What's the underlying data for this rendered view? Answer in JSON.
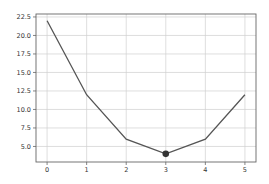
{
  "chart_data": {
    "type": "line",
    "title": "",
    "xlabel": "",
    "ylabel": "",
    "x": [
      0,
      1,
      2,
      3,
      4,
      5
    ],
    "series": [
      {
        "name": "",
        "values": [
          22,
          12,
          6,
          4,
          6,
          12
        ],
        "color": "#555555"
      }
    ],
    "highlight_point": {
      "x": 3,
      "y": 4,
      "color": "#333333"
    },
    "xticks": [
      "0",
      "1",
      "2",
      "3",
      "4",
      "5"
    ],
    "yticks": [
      "5.0",
      "7.5",
      "10.0",
      "12.5",
      "15.0",
      "17.5",
      "20.0",
      "22.5"
    ],
    "xlim": [
      -0.28,
      5.28
    ],
    "ylim": [
      2.9,
      22.9
    ],
    "grid": true,
    "legend": null
  }
}
